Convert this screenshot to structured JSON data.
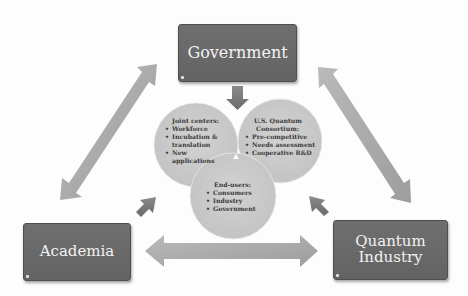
{
  "diagram": {
    "nodes": {
      "government": {
        "label": "Government"
      },
      "academia": {
        "label": "Academia"
      },
      "quantum_industry": {
        "label_line1": "Quantum",
        "label_line2": "Industry"
      }
    },
    "circles": {
      "joint_centers": {
        "title": "Joint centers:",
        "items": [
          "Workforce",
          "Incubation &",
          "translation",
          "New",
          "applications"
        ],
        "bullets": [
          "Workforce",
          "Incubation & translation",
          "New applications"
        ]
      },
      "consortium": {
        "title_line1": "U.S. Quantum",
        "title_line2": "Consortium:",
        "items": [
          "Pre-competitive",
          "Needs assessment",
          "Cooperative R&D"
        ]
      },
      "end_users": {
        "title": "End-users:",
        "items": [
          "Consumers",
          "Industry",
          "Government"
        ]
      }
    },
    "edges": [
      {
        "from": "Government",
        "to": "Academia",
        "type": "bidirectional"
      },
      {
        "from": "Government",
        "to": "Quantum Industry",
        "type": "bidirectional"
      },
      {
        "from": "Academia",
        "to": "Quantum Industry",
        "type": "bidirectional"
      },
      {
        "from": "Government",
        "to": "center",
        "type": "directed"
      },
      {
        "from": "Academia",
        "to": "center",
        "type": "directed"
      },
      {
        "from": "Quantum Industry",
        "to": "center",
        "type": "directed"
      }
    ],
    "colors": {
      "box_fill": "#666666",
      "box_text": "#f2f2f2",
      "circle_fill": "#c9c9c9",
      "arrow_fill": "#a8a8a8",
      "small_arrow_fill": "#777777",
      "circle_text": "#3a3a3a"
    }
  }
}
